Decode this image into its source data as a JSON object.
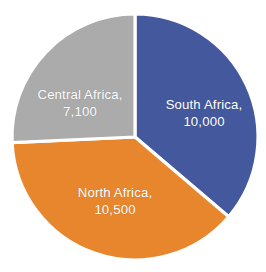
{
  "chart_data": {
    "type": "pie",
    "title": "",
    "subtitle": "",
    "xlabel": "",
    "ylabel": "",
    "legend_position": "none",
    "grid": false,
    "labels_inside_slices": true,
    "total": 27600,
    "categories": [
      "South Africa",
      "North Africa",
      "Central Africa"
    ],
    "values": [
      10000,
      10500,
      7100
    ],
    "slices": [
      {
        "name": "South Africa",
        "value": 10000,
        "value_text": "10,000",
        "label_line1": "South Africa,",
        "label_line2": "10,000",
        "color": "#44589E",
        "percent": 36.2,
        "start_angle_deg": 0,
        "end_angle_deg": 130.4
      },
      {
        "name": "North Africa",
        "value": 10500,
        "value_text": "10,500",
        "label_line1": "North Africa,",
        "label_line2": "10,500",
        "color": "#E8862E",
        "percent": 38.0,
        "start_angle_deg": 130.4,
        "end_angle_deg": 267.4
      },
      {
        "name": "Central Africa",
        "value": 7100,
        "value_text": "7,100",
        "label_line1": "Central Africa,",
        "label_line2": "7,100",
        "color": "#ABABAB",
        "percent": 25.7,
        "start_angle_deg": 267.4,
        "end_angle_deg": 360
      }
    ],
    "colors": {
      "south_africa": "#44589E",
      "north_africa": "#E8862E",
      "central_africa": "#ABABAB",
      "label_text": "#FFFFFF",
      "separator": "#FFFFFF",
      "background": "#FFFFFF"
    },
    "geometry": {
      "center_x": 135,
      "center_y": 137,
      "radius": 123
    }
  }
}
